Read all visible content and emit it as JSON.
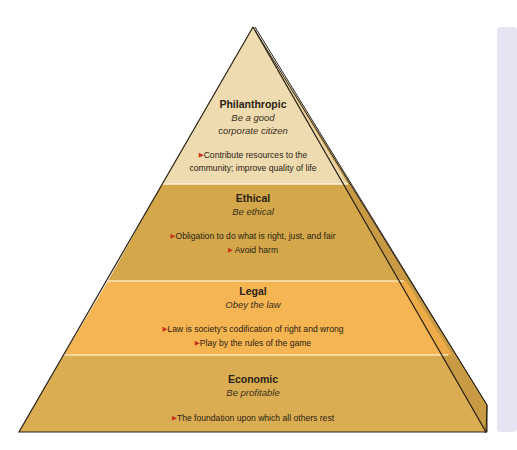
{
  "colors": {
    "philanthropic": "#eedcb0",
    "ethical": "#d4a84a",
    "legal": "#f5b552",
    "economic": "#dbad52",
    "side_face": "#c99a44",
    "outline": "#2a2214",
    "bullet": "#c8361e",
    "panel": "#e6e4f3"
  },
  "pyramid": {
    "layers": [
      {
        "key": "philanthropic",
        "title": "Philanthropic",
        "subtitle_lines": [
          "Be a good",
          "corporate citizen"
        ],
        "bullets": [
          "Contribute resources to the",
          "community; improve quality of life"
        ]
      },
      {
        "key": "ethical",
        "title": "Ethical",
        "subtitle_lines": [
          "Be ethical"
        ],
        "bullets": [
          "Obligation to do what is right, just, and fair",
          "Avoid harm"
        ]
      },
      {
        "key": "legal",
        "title": "Legal",
        "subtitle_lines": [
          "Obey the law"
        ],
        "bullets": [
          "Law is society's codification of right and wrong",
          "Play by the rules of the game"
        ]
      },
      {
        "key": "economic",
        "title": "Economic",
        "subtitle_lines": [
          "Be profitable"
        ],
        "bullets": [
          "The foundation upon which all others rest"
        ]
      }
    ],
    "bullet_glyph": "▶"
  }
}
